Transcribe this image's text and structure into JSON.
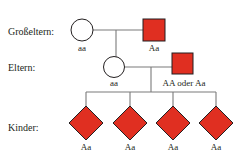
{
  "diagram": {
    "type": "pedigree",
    "colors": {
      "affected_fill": "#e02f21",
      "affected_stroke": "#231f20",
      "unaffected_fill": "#ffffff",
      "line": "#7a7a7a",
      "text": "#231f20",
      "background": "#ffffff"
    }
  },
  "rows": [
    {
      "key": "grandparents",
      "label": "Großeltern:"
    },
    {
      "key": "parents",
      "label": "Eltern:"
    },
    {
      "key": "children",
      "label": "Kinder:"
    }
  ],
  "generations": {
    "grandparents": {
      "label": "Großeltern:",
      "individuals": [
        {
          "id": "gp-mother",
          "shape": "circle",
          "sex": "female",
          "affected": false,
          "genotype": "aa"
        },
        {
          "id": "gp-father",
          "shape": "square",
          "sex": "male",
          "affected": true,
          "genotype": "Aa"
        }
      ]
    },
    "parents": {
      "label": "Eltern:",
      "individuals": [
        {
          "id": "p-mother",
          "shape": "circle",
          "sex": "female",
          "affected": false,
          "genotype": "aa"
        },
        {
          "id": "p-father",
          "shape": "square",
          "sex": "male",
          "affected": true,
          "genotype": "AA oder Aa"
        }
      ]
    },
    "children": {
      "label": "Kinder:",
      "individuals": [
        {
          "id": "child-1",
          "shape": "diamond",
          "sex": "unknown",
          "affected": true,
          "genotype": "Aa"
        },
        {
          "id": "child-2",
          "shape": "diamond",
          "sex": "unknown",
          "affected": true,
          "genotype": "Aa"
        },
        {
          "id": "child-3",
          "shape": "diamond",
          "sex": "unknown",
          "affected": true,
          "genotype": "Aa"
        },
        {
          "id": "child-4",
          "shape": "diamond",
          "sex": "unknown",
          "affected": true,
          "genotype": "Aa"
        }
      ]
    }
  }
}
